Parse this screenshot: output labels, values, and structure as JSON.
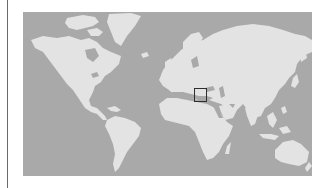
{
  "map": {
    "type": "world-map",
    "projection": "mercator",
    "colors": {
      "ocean": "#a9a9a9",
      "land": "#e3e3e3",
      "highlight_border": "#2e2e2e",
      "background": "#ffffff",
      "divider": "#6a6a6a"
    },
    "highlight": {
      "region": "Italy / Central Mediterranean",
      "shape": "rectangle"
    },
    "continents": [
      "North America",
      "Greenland",
      "South America",
      "Europe",
      "Africa",
      "Asia",
      "Australia"
    ]
  }
}
